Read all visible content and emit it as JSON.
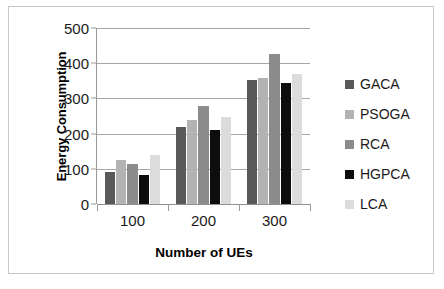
{
  "chart_data": {
    "type": "bar",
    "title": "",
    "xlabel": "Number of UEs",
    "ylabel": "Energy Consumption",
    "categories": [
      "100",
      "200",
      "300"
    ],
    "series": [
      {
        "name": "GACA",
        "color": "#595959",
        "values": [
          92,
          219,
          353
        ]
      },
      {
        "name": "PSOGA",
        "color": "#b3b3b3",
        "values": [
          124,
          239,
          358
        ]
      },
      {
        "name": "RCA",
        "color": "#8c8c8c",
        "values": [
          114,
          278,
          427
        ]
      },
      {
        "name": "HGPCA",
        "color": "#0d0d0d",
        "values": [
          82,
          209,
          344
        ]
      },
      {
        "name": "LCA",
        "color": "#dcdcdc",
        "values": [
          140,
          247,
          368
        ]
      }
    ],
    "ylim": [
      0,
      500
    ],
    "yticks": [
      0,
      100,
      200,
      300,
      400,
      500
    ],
    "ytick_labels": [
      "0",
      "100",
      "200",
      "300",
      "400",
      "500"
    ],
    "grid": true,
    "legend_position": "right"
  },
  "frame": {
    "border_color": "#c8c8c8",
    "background": "#ffffff"
  }
}
